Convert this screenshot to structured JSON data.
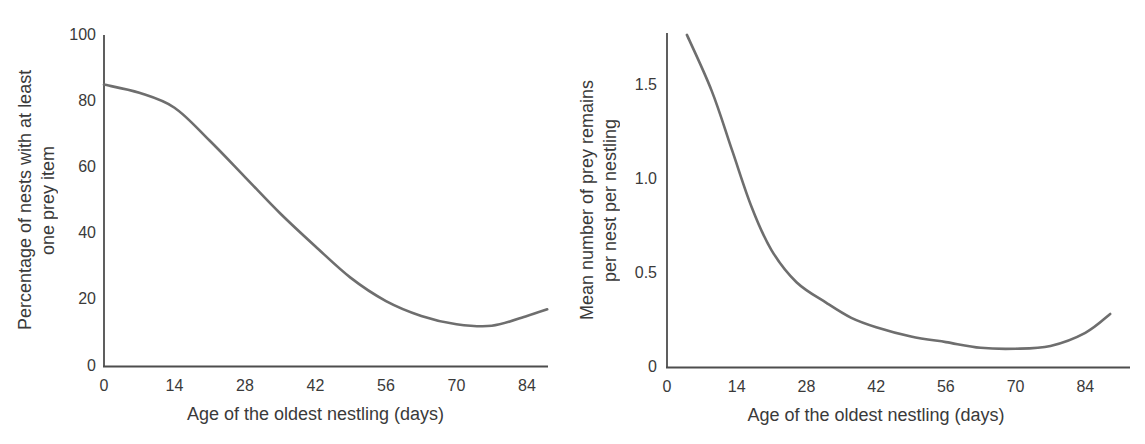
{
  "figure": {
    "background": "#ffffff",
    "line_color": "#6e6e6e",
    "axis_color": "#4d4d4d",
    "text_color": "#3a3a3a"
  },
  "chart_data": [
    {
      "type": "line",
      "title": "",
      "xlabel": "Age of the oldest nestling (days)",
      "ylabel": "Percentage of nests with at least one prey item",
      "ylabel_lines": [
        "Percentage of nests with at least",
        "one prey item"
      ],
      "xlim": [
        0,
        88
      ],
      "ylim": [
        0,
        100
      ],
      "xticks": [
        0,
        14,
        28,
        42,
        56,
        70,
        84
      ],
      "xtick_labels": [
        "0",
        "14",
        "28",
        "42",
        "56",
        "70",
        "84"
      ],
      "yticks": [
        0,
        20,
        40,
        60,
        80,
        100
      ],
      "ytick_labels": [
        "0",
        "20",
        "40",
        "60",
        "80",
        "100"
      ],
      "grid": false,
      "legend": false,
      "series": [
        {
          "name": "fitted curve",
          "x": [
            0,
            7,
            14,
            21,
            28,
            35,
            42,
            49,
            56,
            63,
            70,
            77,
            84,
            88
          ],
          "y": [
            85,
            82.5,
            78,
            68,
            57,
            46,
            36,
            26.5,
            19.5,
            15,
            12.5,
            12,
            15,
            17
          ]
        }
      ]
    },
    {
      "type": "line",
      "title": "",
      "xlabel": "Age of the oldest nestling (days)",
      "ylabel": "Mean number of prey remains per nest per nestling",
      "ylabel_lines": [
        "Mean number of prey remains",
        "per nest per nestling"
      ],
      "xlim": [
        0,
        93
      ],
      "ylim": [
        0,
        1.78
      ],
      "xticks": [
        0,
        14,
        28,
        42,
        56,
        70,
        84
      ],
      "xtick_labels": [
        "0",
        "14",
        "28",
        "42",
        "56",
        "70",
        "84"
      ],
      "yticks": [
        0,
        0.5,
        1.0,
        1.5
      ],
      "ytick_labels": [
        "0",
        "0.5",
        "1.0",
        "1.5"
      ],
      "grid": false,
      "legend": false,
      "series": [
        {
          "name": "fitted curve",
          "x": [
            4,
            9,
            13,
            17,
            21,
            26,
            32,
            37,
            42,
            49,
            56,
            63,
            70,
            77,
            84,
            89
          ],
          "y": [
            1.77,
            1.47,
            1.16,
            0.85,
            0.62,
            0.45,
            0.34,
            0.26,
            0.21,
            0.16,
            0.13,
            0.1,
            0.095,
            0.11,
            0.18,
            0.28
          ]
        }
      ]
    }
  ]
}
